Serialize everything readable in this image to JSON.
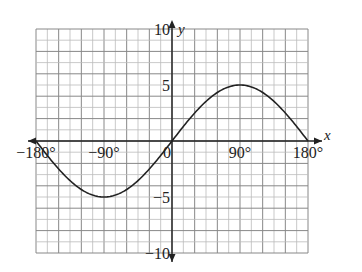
{
  "chart_data": {
    "type": "line",
    "title": "",
    "function": "y = 5 sin x",
    "xlabel": "x",
    "ylabel": "y",
    "xlim": [
      -180,
      180
    ],
    "ylim": [
      -10,
      10
    ],
    "grid": true,
    "x_ticks": [
      {
        "value": -180,
        "label": "−180°"
      },
      {
        "value": -90,
        "label": "−90°"
      },
      {
        "value": 0,
        "label": "0"
      },
      {
        "value": 90,
        "label": "90°"
      },
      {
        "value": 180,
        "label": "180°"
      }
    ],
    "y_ticks": [
      {
        "value": 10,
        "label": "10"
      },
      {
        "value": 5,
        "label": "5"
      },
      {
        "value": -5,
        "label": "−5"
      },
      {
        "value": -10,
        "label": "−10"
      }
    ],
    "series": [
      {
        "name": "y = 5 sin x",
        "x": [
          -180,
          -150,
          -120,
          -90,
          -60,
          -30,
          0,
          30,
          60,
          90,
          120,
          150,
          180
        ],
        "values": [
          0,
          -2.5,
          -4.33,
          -5,
          -4.33,
          -2.5,
          0,
          2.5,
          4.33,
          5,
          4.33,
          2.5,
          0
        ]
      }
    ],
    "colors": {
      "curve": "#222222",
      "axes": "#222222",
      "grid_major": "#888888",
      "grid_minor": "#bbbbbb"
    }
  }
}
